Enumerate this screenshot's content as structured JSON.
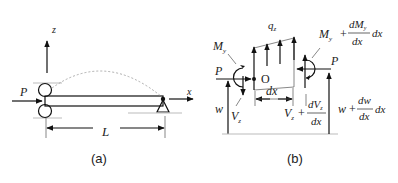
{
  "figure_a": {
    "caption": "(a)",
    "axis_z": "z",
    "axis_x": "x",
    "load": "P",
    "length": "L"
  },
  "figure_b": {
    "caption": "(b)",
    "distributed_load": "q",
    "distributed_load_sub": "z",
    "origin": "O",
    "element_length": "dx",
    "left": {
      "axial": "P",
      "moment": "M",
      "moment_sub": "y",
      "shear": "V",
      "shear_sub": "z",
      "deflection": "w"
    },
    "right": {
      "axial": "P",
      "moment_base": "M",
      "moment_base_sub": "y",
      "moment_plus": "+",
      "moment_num": "dM",
      "moment_num_sub": "y",
      "moment_den": "dx",
      "moment_tail": "dx",
      "shear_base": "V",
      "shear_base_sub": "z",
      "shear_plus": "+",
      "shear_num": "dV",
      "shear_num_sub": "z",
      "shear_den": "dx",
      "defl_base": "w",
      "defl_plus": "+",
      "defl_num": "dw",
      "defl_den": "dx",
      "defl_tail": "dx"
    }
  }
}
